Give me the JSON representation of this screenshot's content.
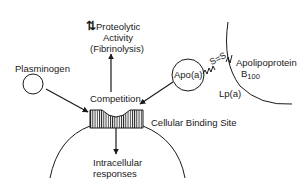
{
  "diagram": {
    "labels": {
      "plasminogen": "Plasminogen",
      "proteolytic_line1": "Proteolytic",
      "proteolytic_line2": "Activity",
      "proteolytic_line3": "(Fibrinolysis)",
      "updown_symbol": "⇅",
      "competition": "Competition",
      "binding_site": "Cellular Binding Site",
      "intracellular_line1": "Intracellular",
      "intracellular_line2": "responses",
      "apoa": "Apo(a)",
      "disulfide": "S=S",
      "apob_line1": "Apolipoprotein",
      "apob_line2": "B",
      "apob_sub": "100",
      "lpa": "Lp(a)"
    },
    "colors": {
      "stroke": "#1a1a1a",
      "background": "#ffffff"
    }
  }
}
